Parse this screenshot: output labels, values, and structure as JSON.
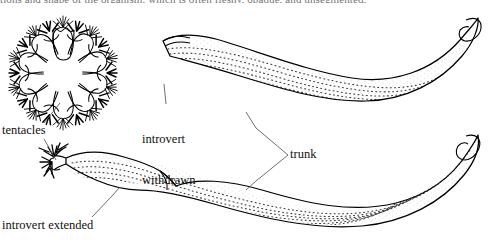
{
  "figure": {
    "kind": "line-drawing",
    "caption_fragment": "tions and shape of the organism, which is often fleshy, opaque, and unsegmented.",
    "ink_color": "#000000",
    "background_color": "#ffffff",
    "stipple_color": "#1a1a1a",
    "leader_color": "#4a4a4a"
  },
  "labels": [
    {
      "id": "tentacles",
      "text": "tentacles",
      "x": 2,
      "y": 124,
      "points_to": [
        "tentacle-crown-oral-view",
        "extended-introvert-tentacles"
      ]
    },
    {
      "id": "introvert_withdrawn",
      "text": "introvert\nwithdrawn",
      "line1": "introvert",
      "line2": "withdrawn",
      "x": 142,
      "y": 106,
      "points_to": [
        "upper-worm-anterior-end"
      ]
    },
    {
      "id": "trunk",
      "text": "trunk",
      "x": 290,
      "y": 148,
      "points_to": [
        "upper-worm-trunk",
        "lower-worm-trunk"
      ]
    },
    {
      "id": "introvert_extended",
      "text": "introvert extended",
      "x": 2,
      "y": 219,
      "points_to": [
        "lower-worm-introvert"
      ]
    }
  ],
  "parts": [
    {
      "id": "tentacle-crown-oral-view",
      "name": "tentacle crown, oral view",
      "description": "radially symmetric ring of lobed petals fringed with bristly tentacles",
      "center_x": 63,
      "center_y": 73,
      "radius": 48,
      "lobes": 10
    },
    {
      "id": "upper-worm",
      "name": "worm with introvert withdrawn",
      "description": "crescent-shaped stippled body curving down-left to up-right",
      "anterior_x": 160,
      "anterior_y": 40
    },
    {
      "id": "lower-worm",
      "name": "worm with introvert extended",
      "description": "elongate stippled body with slender anterior introvert bearing tentacles",
      "anterior_x": 52,
      "anterior_y": 155
    }
  ]
}
